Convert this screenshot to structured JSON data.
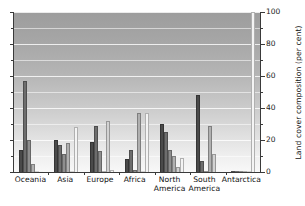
{
  "chart_data": {
    "type": "bar",
    "title": "",
    "subtitle": "",
    "xlabel": "",
    "ylabel": "Land cover composition (per cent)",
    "ylim": [
      0,
      100
    ],
    "yticks": [
      0,
      20,
      40,
      60,
      80,
      100
    ],
    "ytick_labels": [
      "0",
      "20",
      "40",
      "60",
      "80",
      "100"
    ],
    "grid": true,
    "legend": "none",
    "categories": [
      "Oceania",
      "Asia",
      "Europe",
      "Africa",
      "North America",
      "South America",
      "Antarctica"
    ],
    "category_lines": [
      [
        "Oceania"
      ],
      [
        "Asia"
      ],
      [
        "Europe"
      ],
      [
        "Africa"
      ],
      [
        "North",
        "America"
      ],
      [
        "South",
        "America"
      ],
      [
        "Antarctica"
      ]
    ],
    "series": [
      {
        "name": "Series 1",
        "color": "#4a4a4a",
        "values": [
          14,
          20,
          19,
          8,
          30,
          48,
          0
        ]
      },
      {
        "name": "Series 2",
        "color": "#6d6d6d",
        "values": [
          57,
          17,
          29,
          14,
          25,
          7,
          0
        ]
      },
      {
        "name": "Series 3",
        "color": "#8e8e8e",
        "values": [
          20,
          11,
          13,
          1,
          14,
          0,
          0
        ]
      },
      {
        "name": "Series 4",
        "color": "#b0b0b0",
        "values": [
          5,
          18,
          0,
          37,
          10,
          29,
          0
        ]
      },
      {
        "name": "Series 5",
        "color": "#d2d2d2",
        "values": [
          0,
          0,
          32,
          0,
          3,
          11,
          0
        ]
      },
      {
        "name": "Series 6",
        "color": "#f4f4f4",
        "values": [
          0,
          28,
          1,
          37,
          9,
          0,
          100
        ]
      }
    ]
  },
  "axis": {
    "y_title": "Land cover composition (per cent)"
  }
}
